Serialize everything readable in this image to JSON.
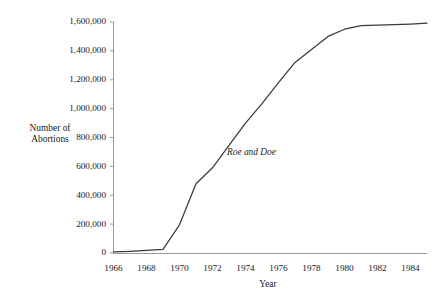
{
  "chart_data": {
    "type": "line",
    "title": "",
    "subtitle": "",
    "xlabel": "Year",
    "ylabel": "Number of\nAbortions",
    "ylabel_line1": "Number of",
    "ylabel_line2": "Abortions",
    "xlim": [
      1966,
      1985
    ],
    "ylim": [
      0,
      1600000
    ],
    "grid": false,
    "legend": null,
    "legend_position": "none",
    "line_color": "#3a3a3a",
    "axis_color": "#8c8c8c",
    "background_color": "#ffffff",
    "text_color": "#1a1a1a",
    "ytick_values": [
      0,
      200000,
      400000,
      600000,
      800000,
      1000000,
      1200000,
      1400000,
      1600000
    ],
    "ytick_labels": [
      "0",
      "200,000",
      "400,000",
      "600,000",
      "800,000",
      "1,000,000",
      "1,200,000",
      "1,400,000",
      "1,600,000"
    ],
    "xtick_values": [
      1966,
      1968,
      1970,
      1972,
      1974,
      1976,
      1978,
      1980,
      1982,
      1984
    ],
    "xtick_labels": [
      "1966",
      "1968",
      "1970",
      "1972",
      "1974",
      "1976",
      "1978",
      "1980",
      "1982",
      "1984"
    ],
    "x": [
      1966,
      1967,
      1968,
      1969,
      1970,
      1971,
      1972,
      1973,
      1974,
      1975,
      1976,
      1977,
      1978,
      1979,
      1980,
      1981,
      1982,
      1983,
      1984,
      1985
    ],
    "values": [
      8000,
      12000,
      18000,
      25000,
      195000,
      480000,
      590000,
      745000,
      900000,
      1035000,
      1180000,
      1320000,
      1410000,
      1500000,
      1550000,
      1575000,
      1578000,
      1582000,
      1586000,
      1592000
    ],
    "series": [
      {
        "name": "Number of Abortions",
        "values": [
          8000,
          12000,
          18000,
          25000,
          195000,
          480000,
          590000,
          745000,
          900000,
          1035000,
          1180000,
          1320000,
          1410000,
          1500000,
          1550000,
          1575000,
          1578000,
          1582000,
          1586000,
          1592000
        ]
      }
    ],
    "annotations": [
      {
        "text": "Roe and Doe",
        "x": 1973,
        "y": 700000,
        "style": "italic"
      }
    ]
  }
}
